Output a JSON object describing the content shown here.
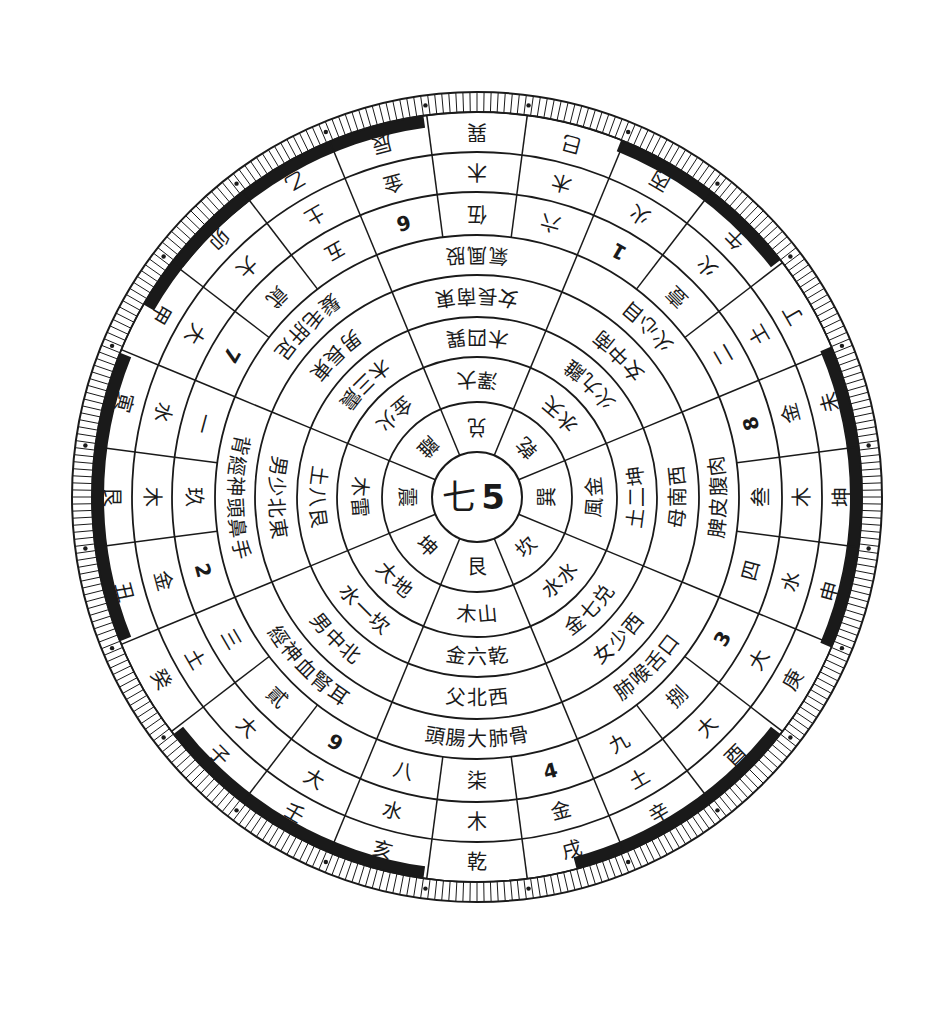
{
  "diagram": {
    "center": {
      "cx": 477,
      "cy": 497
    },
    "colors": {
      "ink": "#1a1a1a",
      "paper": "#ffffff"
    },
    "hub": {
      "chars": [
        "七",
        "5"
      ]
    },
    "ring_trigrams": {
      "r_in": 45,
      "r_out": 95,
      "sectors": 8,
      "start_deg": -22.5,
      "labels_clockwise_from_top": [
        "兑",
        "乾",
        "巽",
        "坎",
        "艮",
        "坤",
        "震",
        "離"
      ]
    },
    "ring2": {
      "r_in": 95,
      "r_out": 140,
      "labels_clockwise_from_top": [
        "大澤",
        "天水",
        "金風",
        "水水",
        "山木",
        "地大",
        "雷木",
        "火金"
      ]
    },
    "ring3": {
      "r_in": 140,
      "r_out": 180,
      "labels_clockwise_from_top": [
        "巽四木",
        "離九火",
        "坤二土",
        "兑七金",
        "乾六金",
        "坎一水",
        "艮八土",
        "震三木"
      ]
    },
    "ring4": {
      "r_in": 180,
      "r_out": 222,
      "labels_clockwise_from_top": [
        "東南長女",
        "南中女",
        "西南母",
        "西少女",
        "西北父",
        "北中男",
        "東北少男",
        "東長男"
      ]
    },
    "ring5": {
      "r_in": 222,
      "r_out": 262,
      "labels_clockwise_from_top": [
        "股風氣",
        "目心火",
        "肉腹皮脾",
        "口舌喉肺",
        "骨肺大腸頭",
        "耳腎血神經",
        "手鼻頭神經背",
        "足肝毛髮"
      ]
    },
    "ring6_numbers": {
      "r_in": 262,
      "r_out": 305,
      "sectors": 24,
      "start_deg": -7.5,
      "labels_clockwise_from_top": [
        "伍",
        "六",
        "1",
        "壹",
        "二",
        "8",
        "叁",
        "四",
        "3",
        "捌",
        "九",
        "4",
        "柒",
        "八",
        "9",
        "貳",
        "三",
        "2",
        "玖",
        "一",
        "7",
        "貮",
        "五",
        "6"
      ]
    },
    "ring7_elements": {
      "r_in": 305,
      "r_out": 345,
      "labels_clockwise_from_top": [
        "木",
        "木",
        "火",
        "火",
        "土",
        "金",
        "木",
        "水",
        "大",
        "大",
        "土",
        "金",
        "木",
        "水",
        "大",
        "大",
        "土",
        "金",
        "木",
        "水",
        "大",
        "大",
        "土",
        "金"
      ]
    },
    "ring8_mountains": {
      "r_in": 345,
      "r_out": 385,
      "labels_clockwise_from_top": [
        "巽",
        "巳",
        "丙",
        "午",
        "丁",
        "未",
        "坤",
        "申",
        "庚",
        "酉",
        "辛",
        "戌",
        "乾",
        "亥",
        "壬",
        "子",
        "癸",
        "丑",
        "艮",
        "寅",
        "甲",
        "卯",
        "乙",
        "辰"
      ]
    },
    "tick_ring": {
      "r_in": 385,
      "r_out": 405,
      "ticks": 360
    },
    "band_pattern": {
      "r_in": 385,
      "r_out": 397,
      "solid_sectors_deg": [
        [
          -52,
          -8
        ],
        [
          22,
          52
        ],
        [
          67,
          113
        ],
        [
          128,
          165
        ],
        [
          188,
          232
        ],
        [
          248,
          292
        ],
        [
          300,
          322
        ]
      ]
    }
  }
}
